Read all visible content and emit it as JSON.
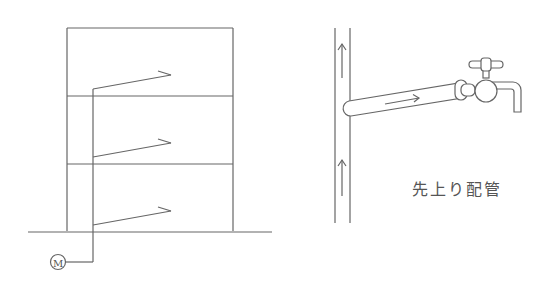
{
  "diagram": {
    "title": "先上り配管",
    "colors": {
      "line": "#555555",
      "background": "#ffffff"
    },
    "left_figure": {
      "description": "building elevation with riser from meter feeding branch pipes on each floor",
      "floors": 3,
      "meter_label": "M",
      "meter_icon": "water-meter-icon"
    },
    "right_figure": {
      "description": "vertical supply pipe with upward-sloping branch to faucet",
      "flow_arrows": [
        "up",
        "up",
        "right"
      ],
      "faucet_icon": "faucet-icon",
      "caption": "先上り配管"
    }
  }
}
